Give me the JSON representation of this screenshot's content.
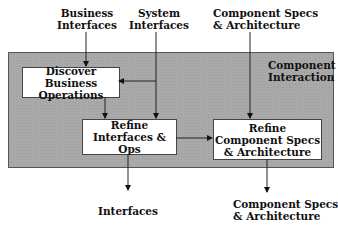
{
  "inputs": {
    "business_interfaces": [
      "Business",
      "Interfaces"
    ],
    "system_interfaces": [
      "System",
      "Interfaces"
    ],
    "component_specs": [
      "Component Specs",
      "& Architecture"
    ]
  },
  "stage": {
    "title": [
      "Component",
      "Interaction"
    ],
    "fill_color": "#a9a9a9"
  },
  "boxes": {
    "discover": [
      "Discover Business",
      "Operations"
    ],
    "refine_interfaces": [
      "Refine",
      "Interfaces & Ops"
    ],
    "refine_component": [
      "Refine",
      "Component Specs",
      "& Architecture"
    ]
  },
  "outputs": {
    "interfaces": [
      "Interfaces"
    ],
    "component_specs": [
      "Component Specs",
      "& Architecture"
    ]
  }
}
